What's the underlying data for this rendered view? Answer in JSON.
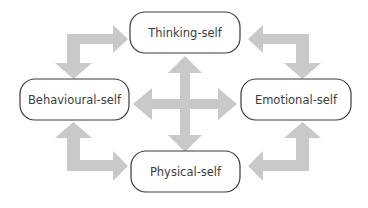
{
  "diagram": {
    "type": "cycle-with-center-cross",
    "nodes": [
      {
        "id": "thinking",
        "label": "Thinking-self"
      },
      {
        "id": "behavioural",
        "label": "Behavioural-self"
      },
      {
        "id": "emotional",
        "label": "Emotional-self"
      },
      {
        "id": "physical",
        "label": "Physical-self"
      }
    ],
    "edges": [
      {
        "from": "behavioural",
        "to": "thinking",
        "style": "bidirectional-elbow-arrow"
      },
      {
        "from": "thinking",
        "to": "emotional",
        "style": "bidirectional-elbow-arrow"
      },
      {
        "from": "emotional",
        "to": "physical",
        "style": "bidirectional-elbow-arrow"
      },
      {
        "from": "physical",
        "to": "behavioural",
        "style": "bidirectional-elbow-arrow"
      },
      {
        "from": "center",
        "to": "all",
        "style": "four-way-cross-arrow"
      }
    ],
    "colors": {
      "arrow": "#c9c9c9",
      "node_border": "#3a3a3a",
      "node_text": "#3c3c3c",
      "background": "#ffffff"
    }
  }
}
